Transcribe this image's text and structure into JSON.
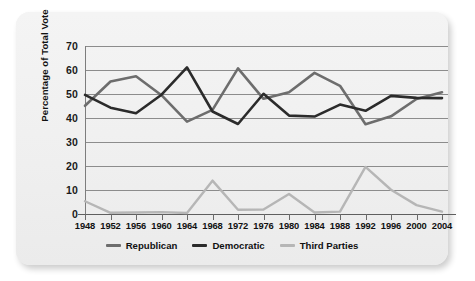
{
  "chart_data": {
    "type": "line",
    "title": "",
    "xlabel": "",
    "ylabel": "Percentage of Total Vote",
    "ylim": [
      0,
      70
    ],
    "yticks": [
      0,
      10,
      20,
      30,
      40,
      50,
      60,
      70
    ],
    "grid": true,
    "legend_position": "bottom-center",
    "categories": [
      "1948",
      "1952",
      "1956",
      "1960",
      "1964",
      "1968",
      "1972",
      "1976",
      "1980",
      "1984",
      "1988",
      "1992",
      "1996",
      "2000",
      "2004"
    ],
    "series": [
      {
        "name": "Republican",
        "color": "#6d6d6d",
        "values": [
          45.1,
          55.2,
          57.4,
          49.5,
          38.5,
          43.4,
          60.7,
          48.0,
          50.7,
          58.8,
          53.4,
          37.4,
          40.7,
          47.9,
          50.7
        ]
      },
      {
        "name": "Democratic",
        "color": "#2b2b2b",
        "values": [
          49.6,
          44.3,
          42.0,
          49.7,
          61.1,
          42.7,
          37.5,
          50.1,
          41.0,
          40.6,
          45.6,
          43.0,
          49.2,
          48.4,
          48.3
        ]
      },
      {
        "name": "Third Parties",
        "color": "#b6b6b6",
        "values": [
          5.3,
          0.5,
          0.6,
          0.8,
          0.4,
          13.9,
          1.8,
          1.9,
          8.3,
          0.6,
          1.0,
          19.6,
          10.1,
          3.7,
          1.0
        ]
      }
    ]
  },
  "axis": {
    "y_tick_labels": [
      "70",
      "60",
      "50",
      "40",
      "30",
      "20",
      "10",
      "0"
    ],
    "y_axis_title": "Percentage of Total Vote",
    "x_tick_labels": [
      "1948",
      "1952",
      "1956",
      "1960",
      "1964",
      "1968",
      "1972",
      "1976",
      "1980",
      "1984",
      "1988",
      "1992",
      "1996",
      "2000",
      "2004"
    ]
  },
  "legend": {
    "items": [
      {
        "label": "Republican",
        "color": "#6d6d6d"
      },
      {
        "label": "Democratic",
        "color": "#2b2b2b"
      },
      {
        "label": "Third Parties",
        "color": "#b6b6b6"
      }
    ]
  }
}
